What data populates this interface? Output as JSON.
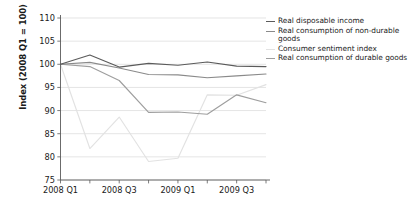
{
  "chart_data": {
    "type": "line",
    "title": "",
    "xlabel": "",
    "ylabel": "Index (2008 Q1 = 100)",
    "ylim": [
      75,
      110
    ],
    "ytick_labels": [
      "110",
      "105",
      "100",
      "95",
      "90",
      "85",
      "80",
      "75"
    ],
    "ytick_values": [
      110,
      105,
      100,
      95,
      90,
      85,
      80,
      75
    ],
    "grid": true,
    "legend_position": "right",
    "x": [
      "2008 Q1",
      "2008 Q2",
      "2008 Q3",
      "2008 Q4",
      "2009 Q1",
      "2009 Q2",
      "2009 Q3",
      "2009 Q4"
    ],
    "xtick_labels": [
      "2008 Q1",
      "",
      "2008 Q3",
      "",
      "2009 Q1",
      "",
      "2009 Q3",
      ""
    ],
    "xtick_labels_shown": [
      "2008 Q1",
      "2008 Q3",
      "2009 Q1",
      "2009 Q3"
    ],
    "series": [
      {
        "name": "Real disposable income",
        "color": "#5b5b5b",
        "values": [
          100.0,
          102.0,
          99.4,
          100.2,
          99.8,
          100.5,
          99.6,
          99.5
        ]
      },
      {
        "name": "Real consumption of non-durable goods",
        "color": "#8a8a8a",
        "values": [
          100.0,
          100.4,
          99.2,
          97.8,
          97.7,
          97.1,
          97.5,
          97.9
        ]
      },
      {
        "name": "Consumer sentiment index",
        "color": "#e2e2e2",
        "values": [
          100.0,
          81.8,
          88.6,
          79.0,
          79.7,
          93.4,
          93.3,
          95.6
        ]
      },
      {
        "name": "Real consumption of durable goods",
        "color": "#9e9e9e",
        "values": [
          100.0,
          99.5,
          96.5,
          89.6,
          89.7,
          89.2,
          93.4,
          91.7
        ]
      }
    ]
  },
  "legend": {
    "items": [
      {
        "label": "Real disposable income",
        "color": "#5b5b5b"
      },
      {
        "label": "Real consumption of non-durable goods",
        "color": "#8a8a8a"
      },
      {
        "label": "Consumer sentiment index",
        "color": "#e2e2e2"
      },
      {
        "label": "Real consumption of durable goods",
        "color": "#9e9e9e"
      }
    ]
  }
}
